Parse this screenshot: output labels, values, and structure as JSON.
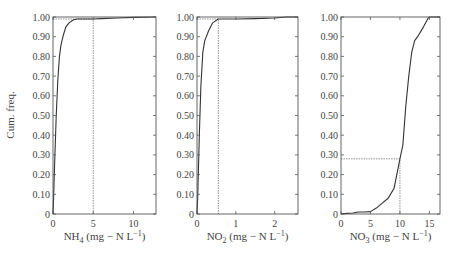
{
  "figure": {
    "ylabel": "Cum. freq."
  },
  "chart_data": [
    {
      "type": "line",
      "title": "",
      "xlabel": "NH4 (mg − N L−1)",
      "xlabel_main": "NH",
      "xlabel_sub": "4",
      "xlabel_rest": " (mg − N L",
      "xlabel_sup": "−1",
      "xlabel_close": ")",
      "ylabel": "Cum. freq.",
      "xlim": [
        0,
        12.8
      ],
      "ylim": [
        0,
        1.0
      ],
      "xticks": [
        0,
        5,
        10
      ],
      "xtick_labels": [
        "0",
        "5",
        "10"
      ],
      "yticks": [
        0,
        0.1,
        0.2,
        0.3,
        0.4,
        0.5,
        0.6,
        0.7,
        0.8,
        0.9,
        1.0
      ],
      "ytick_labels": [
        "0",
        "0.10",
        "0.20",
        "0.30",
        "0.40",
        "0.50",
        "0.60",
        "0.70",
        "0.80",
        "0.90",
        "1.00"
      ],
      "series": [
        {
          "name": "NH4 cumulative frequency",
          "x": [
            0,
            0.05,
            0.2,
            0.4,
            0.6,
            0.8,
            1.0,
            1.3,
            1.6,
            2.0,
            2.5,
            3.0,
            4.0,
            5.0,
            6.0,
            8.0,
            10.0,
            12.8
          ],
          "y": [
            0,
            0.05,
            0.25,
            0.5,
            0.68,
            0.8,
            0.86,
            0.91,
            0.95,
            0.97,
            0.985,
            0.99,
            0.99,
            0.99,
            0.992,
            0.995,
            0.998,
            1.0
          ]
        }
      ],
      "reference_lines": [
        {
          "type": "horizontal",
          "y": 0.99,
          "x_from": 0,
          "x_to": 5
        },
        {
          "type": "vertical",
          "x": 5,
          "y_from": 0,
          "y_to": 0.99
        }
      ],
      "grid": false
    },
    {
      "type": "line",
      "title": "",
      "xlabel": "NO2 (mg − N L−1)",
      "xlabel_main": "NO",
      "xlabel_sub": "2",
      "xlabel_rest": " (mg − N L",
      "xlabel_sup": "−1",
      "xlabel_close": ")",
      "ylabel": "",
      "xlim": [
        0,
        2.6
      ],
      "ylim": [
        0,
        1.0
      ],
      "xticks": [
        0,
        1,
        2
      ],
      "xtick_labels": [
        "0",
        "1",
        "2"
      ],
      "yticks": [
        0,
        0.1,
        0.2,
        0.3,
        0.4,
        0.5,
        0.6,
        0.7,
        0.8,
        0.9,
        1.0
      ],
      "ytick_labels": [
        "0",
        "0.10",
        "0.20",
        "0.30",
        "0.40",
        "0.50",
        "0.60",
        "0.70",
        "0.80",
        "0.90",
        "1.00"
      ],
      "series": [
        {
          "name": "NO2 cumulative frequency",
          "x": [
            0,
            0.02,
            0.06,
            0.1,
            0.15,
            0.2,
            0.3,
            0.4,
            0.55,
            0.8,
            1.0,
            1.5,
            2.0,
            2.3,
            2.6
          ],
          "y": [
            0,
            0.1,
            0.4,
            0.65,
            0.82,
            0.88,
            0.93,
            0.97,
            0.99,
            0.99,
            0.99,
            0.992,
            0.995,
            1.0,
            1.0
          ]
        }
      ],
      "reference_lines": [
        {
          "type": "horizontal",
          "y": 0.99,
          "x_from": 0,
          "x_to": 0.55
        },
        {
          "type": "vertical",
          "x": 0.55,
          "y_from": 0,
          "y_to": 0.99
        }
      ],
      "grid": false
    },
    {
      "type": "line",
      "title": "",
      "xlabel": "NO3 (mg − N L−1)",
      "xlabel_main": "NO",
      "xlabel_sub": "3",
      "xlabel_rest": " (mg − N L",
      "xlabel_sup": "−1",
      "xlabel_close": ")",
      "ylabel": "",
      "xlim": [
        0,
        16.8
      ],
      "ylim": [
        0,
        1.0
      ],
      "xticks": [
        0,
        5,
        10,
        15
      ],
      "xtick_labels": [
        "0",
        "5",
        "10",
        "15"
      ],
      "yticks": [
        0,
        0.1,
        0.2,
        0.3,
        0.4,
        0.5,
        0.6,
        0.7,
        0.8,
        0.9,
        1.0
      ],
      "ytick_labels": [
        "0",
        "0.10",
        "0.20",
        "0.30",
        "0.40",
        "0.50",
        "0.60",
        "0.70",
        "0.80",
        "0.90",
        "1.00"
      ],
      "series": [
        {
          "name": "NO3 cumulative frequency",
          "x": [
            0,
            1,
            2,
            3,
            4,
            5,
            6,
            7,
            8,
            9,
            10,
            10.5,
            11,
            11.5,
            12,
            12.5,
            13,
            14,
            14.7,
            15,
            16.8
          ],
          "y": [
            0,
            0.003,
            0.005,
            0.01,
            0.01,
            0.012,
            0.03,
            0.055,
            0.08,
            0.13,
            0.28,
            0.35,
            0.55,
            0.7,
            0.82,
            0.88,
            0.9,
            0.95,
            0.99,
            1.0,
            1.0
          ]
        }
      ],
      "reference_lines": [
        {
          "type": "horizontal",
          "y": 0.28,
          "x_from": 0,
          "x_to": 10
        },
        {
          "type": "vertical",
          "x": 10,
          "y_from": 0,
          "y_to": 0.28
        }
      ],
      "grid": false
    }
  ],
  "layout": {
    "panels": [
      {
        "left": 53,
        "right": 156,
        "top": 17,
        "bottom": 214
      },
      {
        "left": 197,
        "right": 298,
        "top": 17,
        "bottom": 214
      },
      {
        "left": 341,
        "right": 440,
        "top": 17,
        "bottom": 214
      }
    ],
    "line_color": "#333333",
    "ref_color": "#777777",
    "axis_color": "#555555"
  }
}
